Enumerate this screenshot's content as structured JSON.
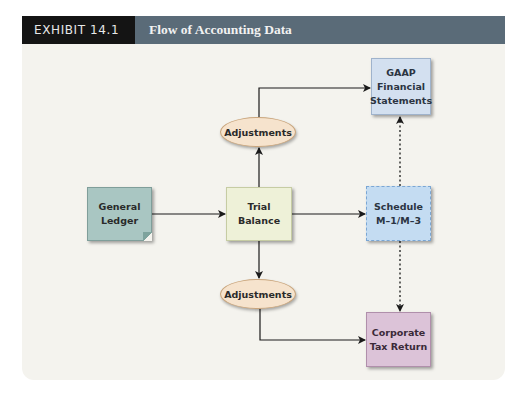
{
  "header": {
    "exhibit_label": "EXHIBIT 14.1",
    "title": "Flow of Accounting Data"
  },
  "colors": {
    "exhibit_bg": "#141414",
    "title_bg": "#5a6b78",
    "panel_bg": "#f4f3ee",
    "gaap_fill": "#d3e0f0",
    "ledger_fill": "#a9c6c2",
    "trial_fill": "#eef1d8",
    "schedule_fill": "#c4dcf2",
    "corp_fill": "#dcc3d8",
    "adjustments_fill": "#f6e3cd"
  },
  "nodes": {
    "gaap": "GAAP\nFinancial\nStatements",
    "general_ledger": "General\nLedger",
    "trial_balance": "Trial\nBalance",
    "schedule": "Schedule\nM–1/M–3",
    "corporate_tax_return": "Corporate\nTax Return",
    "adjustments_top": "Adjustments",
    "adjustments_bottom": "Adjustments"
  },
  "edges": [
    {
      "from": "General Ledger",
      "to": "Trial Balance",
      "style": "solid"
    },
    {
      "from": "Trial Balance",
      "to": "Adjustments (top)",
      "style": "solid"
    },
    {
      "from": "Adjustments (top)",
      "to": "GAAP Financial Statements",
      "style": "solid"
    },
    {
      "from": "Trial Balance",
      "to": "Schedule M–1/M–3",
      "style": "solid"
    },
    {
      "from": "Schedule M–1/M–3",
      "to": "GAAP Financial Statements",
      "style": "dashed"
    },
    {
      "from": "Trial Balance",
      "to": "Adjustments (bottom)",
      "style": "solid"
    },
    {
      "from": "Adjustments (bottom)",
      "to": "Corporate Tax Return",
      "style": "solid"
    },
    {
      "from": "Schedule M–1/M–3",
      "to": "Corporate Tax Return",
      "style": "dashed"
    }
  ]
}
